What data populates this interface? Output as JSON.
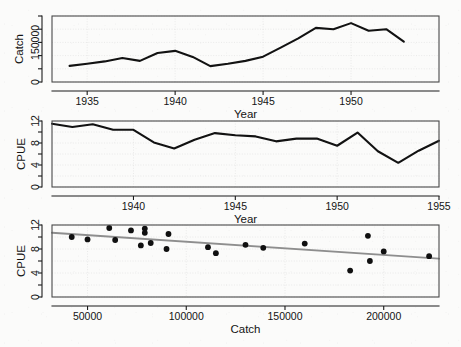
{
  "figure": {
    "background_color": "#fbfbfa",
    "line_color": "#121212",
    "regression_color": "#8e8e8e",
    "point_color": "#101010",
    "panel_border_color": "#4a4a4a"
  },
  "chart_data": [
    {
      "type": "line",
      "title": "",
      "xlabel": "Year",
      "ylabel": "Catch",
      "xlim": [
        1933,
        1955
      ],
      "ylim": [
        0,
        250000
      ],
      "grid": true,
      "xticks": [
        1935,
        1940,
        1945,
        1950
      ],
      "xtick_labels": [
        "1935",
        "1940",
        "1945",
        "1950"
      ],
      "yticks": [
        0,
        50000,
        100000,
        150000,
        200000,
        250000
      ],
      "ytick_labels": [
        "0",
        "",
        "",
        "150000",
        "",
        ""
      ],
      "x": [
        1934,
        1935,
        1936,
        1937,
        1938,
        1939,
        1940,
        1941,
        1942,
        1943,
        1944,
        1945,
        1946,
        1947,
        1948,
        1949,
        1950,
        1951,
        1952,
        1953
      ],
      "values": [
        61000,
        69000,
        78000,
        91000,
        80000,
        110000,
        118000,
        95000,
        60000,
        69000,
        80000,
        96000,
        130000,
        165000,
        205000,
        200000,
        223000,
        194000,
        200000,
        153000
      ]
    },
    {
      "type": "line",
      "title": "",
      "xlabel": "Year",
      "ylabel": "CPUE",
      "xlim": [
        1936,
        1955
      ],
      "ylim": [
        0,
        12
      ],
      "grid": true,
      "xticks": [
        1940,
        1945,
        1950,
        1955
      ],
      "xtick_labels": [
        "1940",
        "1945",
        "1950",
        "1955"
      ],
      "yticks": [
        0,
        2,
        4,
        6,
        8,
        10,
        12
      ],
      "ytick_labels": [
        "0",
        "",
        "4",
        "",
        "8",
        "",
        "12"
      ],
      "x": [
        1936,
        1937,
        1938,
        1939,
        1940,
        1941,
        1942,
        1943,
        1944,
        1945,
        1946,
        1947,
        1948,
        1949,
        1950,
        1951,
        1952,
        1953,
        1954,
        1955
      ],
      "values": [
        11.5,
        10.9,
        11.4,
        10.4,
        10.4,
        8.1,
        7.0,
        8.6,
        9.8,
        9.4,
        9.2,
        8.3,
        8.8,
        8.8,
        7.5,
        9.9,
        6.5,
        4.4,
        6.6,
        8.4
      ]
    },
    {
      "type": "scatter",
      "title": "",
      "xlabel": "Catch",
      "ylabel": "CPUE",
      "xlim": [
        32000,
        228000
      ],
      "ylim": [
        0,
        12
      ],
      "grid": true,
      "xticks": [
        50000,
        100000,
        150000,
        200000
      ],
      "xtick_labels": [
        "50000",
        "100000",
        "150000",
        "200000"
      ],
      "yticks": [
        0,
        2,
        4,
        6,
        8,
        10,
        12
      ],
      "ytick_labels": [
        "0",
        "",
        "4",
        "",
        "8",
        "",
        "12"
      ],
      "points": [
        {
          "x": 42000,
          "y": 10.0
        },
        {
          "x": 50000,
          "y": 9.6
        },
        {
          "x": 61000,
          "y": 11.5
        },
        {
          "x": 64000,
          "y": 9.5
        },
        {
          "x": 72000,
          "y": 11.1
        },
        {
          "x": 77000,
          "y": 8.6
        },
        {
          "x": 79000,
          "y": 11.4
        },
        {
          "x": 79000,
          "y": 10.7
        },
        {
          "x": 82000,
          "y": 9.0
        },
        {
          "x": 90000,
          "y": 8.0
        },
        {
          "x": 91000,
          "y": 10.5
        },
        {
          "x": 111000,
          "y": 8.3
        },
        {
          "x": 115000,
          "y": 7.3
        },
        {
          "x": 130000,
          "y": 8.7
        },
        {
          "x": 139000,
          "y": 8.2
        },
        {
          "x": 160000,
          "y": 8.9
        },
        {
          "x": 183000,
          "y": 4.4
        },
        {
          "x": 192000,
          "y": 10.2
        },
        {
          "x": 193000,
          "y": 6.0
        },
        {
          "x": 200000,
          "y": 7.6
        },
        {
          "x": 223000,
          "y": 6.8
        }
      ],
      "regression": {
        "x_start": 32000,
        "y_start": 10.7,
        "x_end": 228000,
        "y_end": 6.4
      }
    }
  ]
}
